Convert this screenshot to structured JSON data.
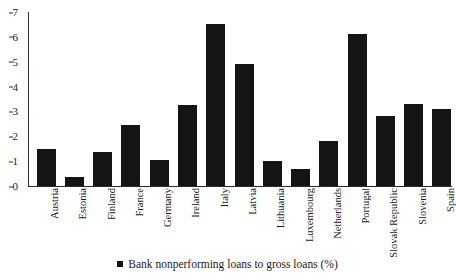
{
  "chart_data": {
    "type": "bar",
    "title": "",
    "subtitle": "",
    "xlabel": "",
    "ylabel": "",
    "ylim": [
      0,
      7
    ],
    "y_ticks": [
      0,
      1,
      2,
      3,
      4,
      5,
      6,
      7
    ],
    "grid": false,
    "legend_position": "bottom-center",
    "bar_color": "#141414",
    "axis_color": "#2b2b2b",
    "categories": [
      "Austria",
      "Estonia",
      "Finland",
      "France",
      "Germany",
      "Ireland",
      "Italy",
      "Latvia",
      "Lithuania",
      "Luxembourg",
      "Netherlands",
      "Portugal",
      "Slovak Republic",
      "Slovenia",
      "Spain"
    ],
    "series": [
      {
        "name": "Bank nonperforming loans to gross loans (%)",
        "values": [
          1.5,
          0.35,
          1.35,
          2.45,
          1.05,
          3.25,
          6.5,
          4.9,
          1.0,
          0.7,
          1.8,
          6.1,
          2.8,
          3.3,
          3.1
        ]
      }
    ],
    "legend": [
      "Bank nonperforming loans to gross loans (%)"
    ]
  },
  "legend": {
    "label": "Bank nonperforming loans to gross loans (%)"
  }
}
